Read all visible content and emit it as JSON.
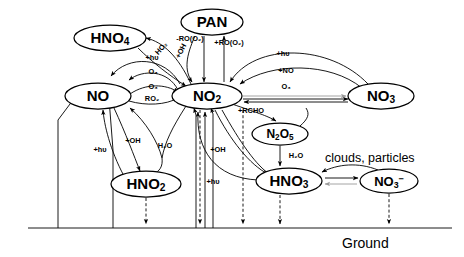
{
  "diagram": {
    "ground_label": "Ground",
    "annotation": "clouds, particles",
    "colors": {
      "stroke": "#000000",
      "background": "#ffffff",
      "grey": "#9a9a9a"
    }
  },
  "nodes": [
    {
      "id": "PAN",
      "label": "PAN",
      "cx": 212,
      "cy": 22,
      "rx": 31,
      "ry": 13,
      "fs": 15
    },
    {
      "id": "HNO4",
      "label": "HNO",
      "sub": "4",
      "cx": 110,
      "cy": 38,
      "rx": 36,
      "ry": 13,
      "fs": 15
    },
    {
      "id": "NO",
      "label": "NO",
      "sub": "",
      "cx": 98,
      "cy": 96,
      "rx": 33,
      "ry": 13,
      "fs": 15
    },
    {
      "id": "NO2",
      "label": "NO",
      "sub": "2",
      "cx": 207,
      "cy": 96,
      "rx": 35,
      "ry": 13,
      "fs": 15
    },
    {
      "id": "NO3",
      "label": "NO",
      "sub": "3",
      "cx": 381,
      "cy": 96,
      "rx": 33,
      "ry": 13,
      "fs": 15
    },
    {
      "id": "N2O5",
      "label": "N",
      "sub": "2O5",
      "cx": 280,
      "cy": 134,
      "rx": 28,
      "ry": 11,
      "fs": 12
    },
    {
      "id": "HNO2",
      "label": "HNO",
      "sub": "2",
      "cx": 146,
      "cy": 184,
      "rx": 35,
      "ry": 13,
      "fs": 15
    },
    {
      "id": "HNO3",
      "label": "HNO",
      "sub": "3",
      "cx": 289,
      "cy": 181,
      "rx": 33,
      "ry": 13,
      "fs": 15
    },
    {
      "id": "NO3m",
      "label": "NO",
      "sub": "3-",
      "cx": 389,
      "cy": 181,
      "rx": 29,
      "ry": 12,
      "fs": 13
    }
  ],
  "reaction_labels": [
    {
      "id": "pan-loss",
      "text": "-RO(O₂)",
      "x": 190,
      "y": 41,
      "rot": 0
    },
    {
      "id": "pan-form",
      "text": "+RO(O₂)",
      "x": 229,
      "y": 45,
      "rot": 0
    },
    {
      "id": "ho2",
      "text": "HO₂",
      "x": 163,
      "y": 50,
      "rot": -48
    },
    {
      "id": "oh-pan",
      "text": "+OH",
      "x": 183,
      "y": 52,
      "rot": -62
    },
    {
      "id": "hnu-hno4",
      "text": "+hυ",
      "x": 152,
      "y": 60,
      "rot": 0
    },
    {
      "id": "o3-top",
      "text": "O₃",
      "x": 153,
      "y": 74,
      "rot": 0
    },
    {
      "id": "o3-mid",
      "text": "O₃",
      "x": 153,
      "y": 89,
      "rot": 0
    },
    {
      "id": "ro2",
      "text": "RO₂",
      "x": 152,
      "y": 101,
      "rot": 0
    },
    {
      "id": "hnu-no3",
      "text": "+hυ",
      "x": 283,
      "y": 56,
      "rot": 0
    },
    {
      "id": "plus-no",
      "text": "+NO",
      "x": 286,
      "y": 73,
      "rot": 0
    },
    {
      "id": "o3-right",
      "text": "O₃",
      "x": 286,
      "y": 89,
      "rot": 0
    },
    {
      "id": "rcho",
      "text": "+RCHO",
      "x": 251,
      "y": 113,
      "rot": 0
    },
    {
      "id": "h2o-n2o5",
      "text": "H₂O",
      "x": 296,
      "y": 158,
      "rot": 0
    },
    {
      "id": "h2o-left",
      "text": "H₂O",
      "x": 165,
      "y": 148,
      "rot": 0
    },
    {
      "id": "oh-hno2",
      "text": "+OH",
      "x": 133,
      "y": 143,
      "rot": 0
    },
    {
      "id": "hnu-hno2",
      "text": "+hυ",
      "x": 100,
      "y": 152,
      "rot": 0
    },
    {
      "id": "oh-hno3",
      "text": "+OH",
      "x": 218,
      "y": 152,
      "rot": 0
    },
    {
      "id": "hnu-bottom",
      "text": "+hυ",
      "x": 213,
      "y": 184,
      "rot": 0
    }
  ]
}
